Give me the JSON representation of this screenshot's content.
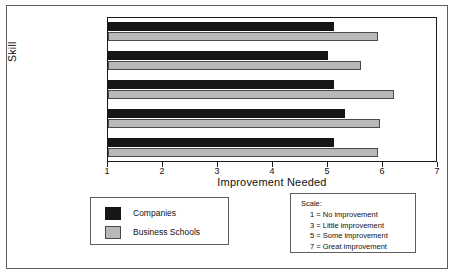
{
  "chart_data": {
    "type": "bar",
    "orientation": "horizontal",
    "title": "",
    "xlabel": "Improvement Needed",
    "ylabel": "Skill",
    "categories": [
      "International Business",
      "Technical",
      "Cross-Cultural",
      "Foreign Language",
      "Country-Specific"
    ],
    "series": [
      {
        "name": "Companies",
        "color": "#161616",
        "values": [
          5.1,
          5.0,
          5.1,
          5.3,
          5.1
        ]
      },
      {
        "name": "Business Schools",
        "color": "#b9b9b9",
        "values": [
          5.9,
          5.6,
          6.2,
          5.95,
          5.9
        ]
      }
    ],
    "xlim": [
      1,
      7
    ],
    "xticks": [
      "1",
      "2",
      "3",
      "4",
      "5",
      "6",
      "7"
    ],
    "grid": false,
    "legend_position": "below-left"
  },
  "legend": {
    "items": [
      {
        "label": "Companies",
        "swatch": "black-swatch"
      },
      {
        "label": "Business Schools",
        "swatch": "gray-swatch"
      }
    ]
  },
  "scale_key": {
    "title": "Scale:",
    "lines": [
      "1 = No improvement",
      "3 = Little improvement",
      "5 = Some improvement",
      "7 = Great improvement"
    ]
  }
}
